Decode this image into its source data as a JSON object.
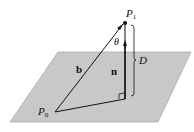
{
  "diagram": {
    "plane_color": "#c8c8c8",
    "labels": {
      "p1": "P",
      "p1_sub": "1",
      "p0": "P",
      "p0_sub": "0",
      "theta": "θ",
      "b": "b",
      "n": "n",
      "d": "D"
    }
  }
}
